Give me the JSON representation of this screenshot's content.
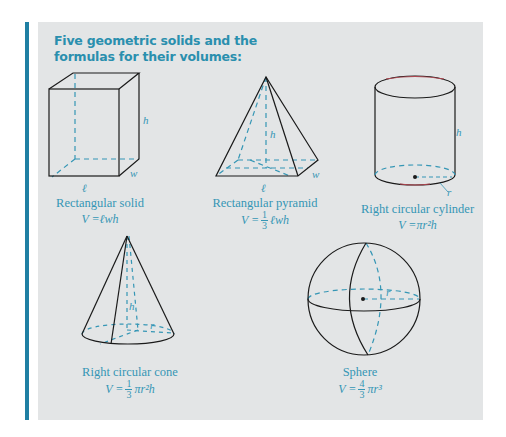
{
  "title": "Five geometric solids and the formulas for their volumes:",
  "colors": {
    "accent": "#1f7fa3",
    "panel_bg": "#e3e5e6",
    "title": "#2a8fae",
    "caption": "#3596b5",
    "edge": "#1a1a1a",
    "hidden_edge": "#3596b5",
    "rim_highlight": "#b0454f"
  },
  "solids": [
    {
      "name": "Rectangular solid",
      "formula": {
        "prefix": "V = ",
        "fraction": null,
        "expr": "ℓwh"
      },
      "labels": {
        "height": "h",
        "width": "w",
        "length": "ℓ"
      }
    },
    {
      "name": "Rectangular pyramid",
      "formula": {
        "prefix": "V = ",
        "fraction": {
          "num": "1",
          "den": "3"
        },
        "expr": "ℓwh"
      },
      "labels": {
        "height": "h",
        "width": "w",
        "length": "ℓ"
      }
    },
    {
      "name": "Right circular cylinder",
      "formula": {
        "prefix": "V = ",
        "fraction": null,
        "expr": "πr²h"
      },
      "labels": {
        "height": "h",
        "radius": "r"
      }
    },
    {
      "name": "Right circular cone",
      "formula": {
        "prefix": "V = ",
        "fraction": {
          "num": "1",
          "den": "3"
        },
        "expr": "πr²h"
      },
      "labels": {
        "height": "h",
        "radius": "r"
      }
    },
    {
      "name": "Sphere",
      "formula": {
        "prefix": "V = ",
        "fraction": {
          "num": "4",
          "den": "3"
        },
        "expr": "πr³"
      },
      "labels": {
        "radius": "r"
      }
    }
  ]
}
